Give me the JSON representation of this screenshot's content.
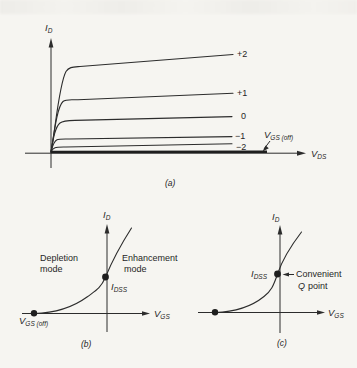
{
  "panel_a": {
    "caption": "(a)",
    "y_axis": {
      "base": "I",
      "sub": "D"
    },
    "x_axis": {
      "base": "V",
      "sub": "DS"
    },
    "curve_labels": [
      "+2",
      "+1",
      "0",
      "−1",
      "−2"
    ],
    "cutoff": {
      "base": "V",
      "sub": "GS (off)"
    }
  },
  "panel_b": {
    "caption": "(b)",
    "y_axis": {
      "base": "I",
      "sub": "D"
    },
    "x_axis": {
      "base": "V",
      "sub": "GS"
    },
    "depletion": {
      "line1": "Depletion",
      "line2": "mode"
    },
    "enhancement": {
      "line1": "Enhancement",
      "line2": "mode"
    },
    "idss": {
      "base": "I",
      "sub": "DSS"
    },
    "cutoff": {
      "base": "V",
      "sub": "GS (off)"
    }
  },
  "panel_c": {
    "caption": "(c)",
    "y_axis": {
      "base": "I",
      "sub": "D"
    },
    "x_axis": {
      "base": "V",
      "sub": "GS"
    },
    "idss": {
      "base": "I",
      "sub": "DSS"
    },
    "q_point": {
      "line1": "Convenient",
      "q": "Q",
      "rest": "point"
    }
  }
}
